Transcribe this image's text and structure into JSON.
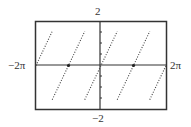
{
  "chart_data": {
    "type": "line",
    "title": "",
    "function": "y = arctan(tan x)",
    "xlabel": "",
    "ylabel": "",
    "xlim": [
      -6.2832,
      6.2832
    ],
    "ylim": [
      -2,
      2
    ],
    "tick_labels": {
      "x_min": "−2π",
      "x_max": "2π",
      "y_max": "2",
      "y_min": "−2"
    },
    "line_style": "dotted",
    "grid": false,
    "legend": null,
    "series": [
      {
        "name": "branch-1",
        "x": [
          -6.2832,
          -4.7124
        ],
        "y": [
          0,
          1.5708
        ]
      },
      {
        "name": "branch-2",
        "x": [
          -4.7124,
          -1.5708
        ],
        "y": [
          -1.5708,
          1.5708
        ]
      },
      {
        "name": "branch-3",
        "x": [
          -1.5708,
          1.5708
        ],
        "y": [
          -1.5708,
          1.5708
        ]
      },
      {
        "name": "branch-4",
        "x": [
          1.5708,
          4.7124
        ],
        "y": [
          -1.5708,
          1.5708
        ]
      },
      {
        "name": "branch-5",
        "x": [
          4.7124,
          6.2832
        ],
        "y": [
          -1.5708,
          0
        ]
      }
    ],
    "points": [
      {
        "x": -3.1416,
        "y": 0,
        "marker": "filled-dot"
      },
      {
        "x": 3.1416,
        "y": 0,
        "marker": "filled-dot"
      }
    ]
  },
  "labels": {
    "top": "2",
    "bottom": "−2",
    "left": "−2π",
    "right": "2π"
  }
}
